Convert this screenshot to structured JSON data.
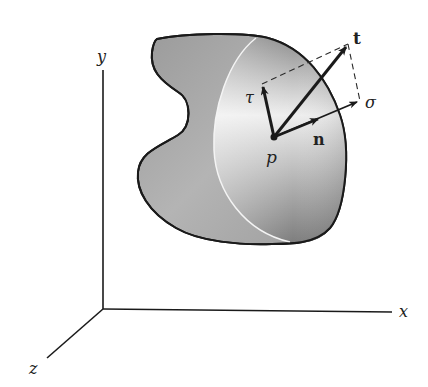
{
  "figure": {
    "axes": {
      "x_label": "x",
      "y_label": "y",
      "z_label": "z"
    },
    "point": {
      "label": "p"
    },
    "vectors": {
      "traction": {
        "label": "t"
      },
      "normal_unit": {
        "label": "n"
      },
      "normal_stress": {
        "label": "σ"
      },
      "shear_stress": {
        "label": "τ"
      }
    },
    "colors": {
      "outline": "#1a1a1a",
      "body_fill": "#a8a8a8",
      "cut_face_highlight": "#f2f2f2",
      "cut_edge": "#f4f4f4",
      "background": "#ffffff"
    }
  }
}
